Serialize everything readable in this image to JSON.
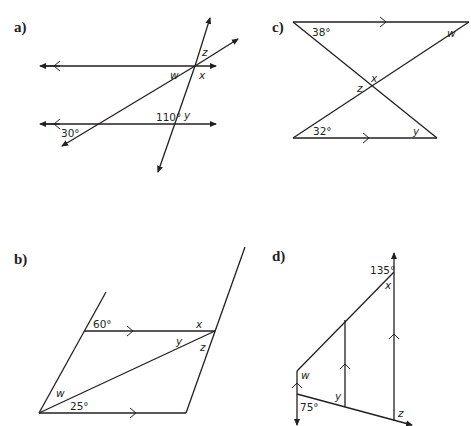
{
  "diagrams": {
    "a": {
      "label": "a)",
      "angles": {
        "given1": "30°",
        "given2": "110°"
      },
      "vars": {
        "w": "w",
        "x": "x",
        "y": "y",
        "z": "z"
      }
    },
    "b": {
      "label": "b)",
      "angles": {
        "given1": "60°",
        "given2": "25°"
      },
      "vars": {
        "w": "w",
        "x": "x",
        "y": "y",
        "z": "z"
      }
    },
    "c": {
      "label": "c)",
      "angles": {
        "given1": "38°",
        "given2": "32°"
      },
      "vars": {
        "w": "w",
        "x": "x",
        "y": "y",
        "z": "z"
      }
    },
    "d": {
      "label": "d)",
      "angles": {
        "given1": "135°",
        "given2": "75°"
      },
      "vars": {
        "w": "w",
        "x": "x",
        "y": "y",
        "z": "z"
      }
    }
  },
  "colors": {
    "ink": "#231f20",
    "background": "#ffffff"
  }
}
